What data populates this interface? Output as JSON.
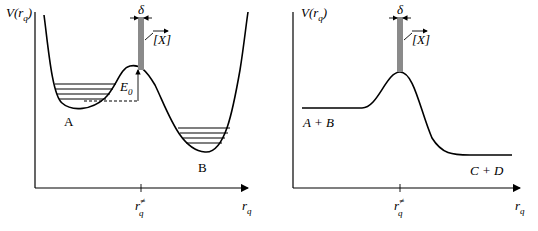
{
  "left_panel": {
    "y_axis_label": "V(r",
    "y_axis_sub": "q",
    "y_axis_close": ")",
    "x_axis_label": "r",
    "x_axis_sub": "q",
    "tick_label": "r",
    "tick_sup": "≠",
    "tick_sub": "q",
    "delta_label": "δ",
    "x_label": "[X]",
    "barrier_label": "E",
    "barrier_sub": "0",
    "well_a_label": "A",
    "well_b_label": "B"
  },
  "right_panel": {
    "y_axis_label": "V(r",
    "y_axis_sub": "q",
    "y_axis_close": ")",
    "x_axis_label": "r",
    "x_axis_sub": "q",
    "tick_label": "r",
    "tick_sup": "≠",
    "tick_sub": "q",
    "delta_label": "δ",
    "x_label": "[X]",
    "reactants_label": "A + B",
    "products_label": "C + D"
  }
}
